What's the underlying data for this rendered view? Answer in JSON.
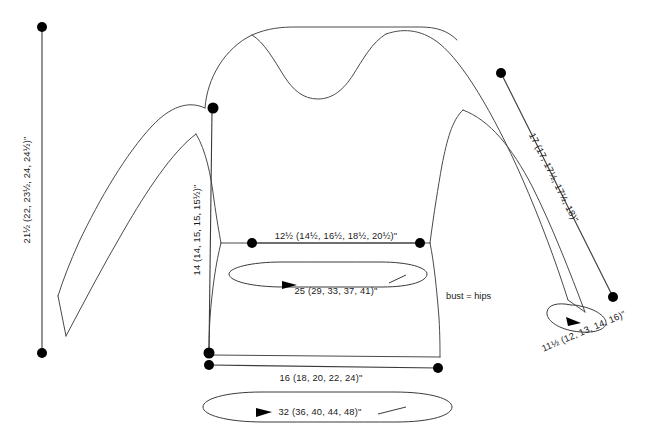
{
  "diagram": {
    "type": "knitting-pattern-schematic",
    "units": "inches",
    "size_count": 5,
    "colors": {
      "outline": "#4a4a4a",
      "measurement_line": "#3a3a3a",
      "dot": "#000000",
      "text": "#1a1a1a",
      "background": "#ffffff"
    }
  },
  "measurements": {
    "total_length": {
      "label": "21½ (22, 23½, 24, 24½)\"",
      "name": "total-garment-length",
      "orientation": "vertical",
      "values": [
        "21½",
        "22",
        "23½",
        "24",
        "24½"
      ]
    },
    "body_length": {
      "label": "14 (14, 15, 15, 15½)\"",
      "name": "body-side-length",
      "orientation": "vertical",
      "values": [
        "14",
        "14",
        "15",
        "15",
        "15½"
      ]
    },
    "bust_width": {
      "label": "12½ (14½, 16½, 18½, 20½)\"",
      "name": "bust-flat-width",
      "orientation": "horizontal",
      "values": [
        "12½",
        "14½",
        "16½",
        "18½",
        "20½"
      ]
    },
    "bust_circumference": {
      "label": "25 (29, 33, 37, 41)\"",
      "name": "bust-circumference",
      "orientation": "circumference",
      "values": [
        "25",
        "29",
        "33",
        "37",
        "41"
      ]
    },
    "hem_width": {
      "label": "16 (18, 20, 22, 24)\"",
      "name": "hem-flat-width",
      "orientation": "horizontal",
      "values": [
        "16",
        "18",
        "20",
        "22",
        "24"
      ]
    },
    "hem_circumference": {
      "label": "32 (36, 40, 44, 48)\"",
      "name": "hem-circumference",
      "orientation": "circumference",
      "values": [
        "32",
        "36",
        "40",
        "44",
        "48"
      ]
    },
    "sleeve_length": {
      "label": "17 (17, 17½, 17½, 18)\"",
      "name": "sleeve-length",
      "orientation": "diagonal",
      "values": [
        "17",
        "17",
        "17½",
        "17½",
        "18"
      ]
    },
    "cuff_circumference": {
      "label": "11½ (12, 13, 14, 16)\"",
      "name": "cuff-circumference",
      "orientation": "circumference",
      "values": [
        "11½",
        "12",
        "13",
        "14",
        "16"
      ]
    }
  },
  "notes": {
    "bust_hips_note": "bust = hips"
  }
}
